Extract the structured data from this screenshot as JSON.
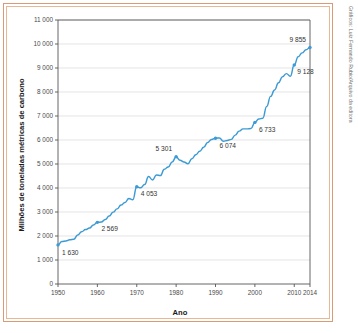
{
  "figure": {
    "credit": "Gráficos: Luiz Fernando Rubio/Arquivo da editora"
  },
  "chart_data": {
    "type": "line",
    "title": "",
    "xlabel": "Ano",
    "ylabel": "Milhões de toneladas métricas de carbono",
    "xlim": [
      1950,
      2014
    ],
    "ylim": [
      0,
      11000
    ],
    "grid": true,
    "legend": "none",
    "series_color": "#3c9ad4",
    "xticks": [
      "1950",
      "1960",
      "1970",
      "1980",
      "1990",
      "2000",
      "2010",
      "2014"
    ],
    "xtick_values": [
      1950,
      1960,
      1970,
      1980,
      1990,
      2000,
      2010,
      2014
    ],
    "yticks": [
      "0",
      "1 000",
      "2 000",
      "3 000",
      "4 000",
      "5 000",
      "6 000",
      "7 000",
      "8 000",
      "9 000",
      "10 000",
      "11 000"
    ],
    "ytick_values": [
      0,
      1000,
      2000,
      3000,
      4000,
      5000,
      6000,
      7000,
      8000,
      9000,
      10000,
      11000
    ],
    "x": [
      1950,
      1951,
      1952,
      1953,
      1954,
      1955,
      1956,
      1957,
      1958,
      1959,
      1960,
      1961,
      1962,
      1963,
      1964,
      1965,
      1966,
      1967,
      1968,
      1969,
      1970,
      1971,
      1972,
      1973,
      1974,
      1975,
      1976,
      1977,
      1978,
      1979,
      1980,
      1981,
      1982,
      1983,
      1984,
      1985,
      1986,
      1987,
      1988,
      1989,
      1990,
      1991,
      1992,
      1993,
      1994,
      1995,
      1996,
      1997,
      1998,
      1999,
      2000,
      2001,
      2002,
      2003,
      2004,
      2005,
      2006,
      2007,
      2008,
      2009,
      2010,
      2011,
      2012,
      2013,
      2014
    ],
    "values": [
      1630,
      1767,
      1795,
      1841,
      1865,
      2043,
      2179,
      2270,
      2330,
      2462,
      2569,
      2580,
      2686,
      2833,
      2995,
      3130,
      3288,
      3393,
      3565,
      3513,
      4053,
      4008,
      4144,
      4477,
      4336,
      4545,
      4518,
      4779,
      4876,
      5084,
      5301,
      5155,
      5085,
      5008,
      5216,
      5384,
      5533,
      5697,
      5898,
      6024,
      6074,
      6085,
      5948,
      5981,
      6027,
      6203,
      6370,
      6464,
      6464,
      6480,
      6733,
      6875,
      6906,
      7397,
      7818,
      8085,
      8384,
      8637,
      8765,
      8657,
      9128,
      9472,
      9630,
      9760,
      9855
    ],
    "labeled_points": [
      {
        "year": 1950,
        "value": 1630,
        "label": "1 630",
        "dx": 4,
        "dy": 10,
        "anchor": "start"
      },
      {
        "year": 1960,
        "value": 2569,
        "label": "2 569",
        "dx": 4,
        "dy": 9,
        "anchor": "start"
      },
      {
        "year": 1970,
        "value": 4053,
        "label": "4 053",
        "dx": 4,
        "dy": 9,
        "anchor": "start"
      },
      {
        "year": 1980,
        "value": 5301,
        "label": "5 301",
        "dx": -4,
        "dy": -6,
        "anchor": "end"
      },
      {
        "year": 1990,
        "value": 6074,
        "label": "6 074",
        "dx": 4,
        "dy": 10,
        "anchor": "start"
      },
      {
        "year": 2000,
        "value": 6733,
        "label": "6 733",
        "dx": 4,
        "dy": 10,
        "anchor": "start"
      },
      {
        "year": 2010,
        "value": 9128,
        "label": "9 128",
        "dx": 3,
        "dy": 9,
        "anchor": "start"
      },
      {
        "year": 2014,
        "value": 9855,
        "label": "9 855",
        "dx": -4,
        "dy": -5,
        "anchor": "end"
      }
    ]
  }
}
